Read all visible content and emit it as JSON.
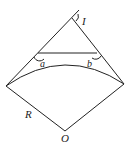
{
  "diagram": {
    "labels": {
      "apex": "I",
      "angle_a": "a",
      "angle_b": "b",
      "radius": "R",
      "center": "O"
    },
    "colors": {
      "stroke": "#222222",
      "background": "#ffffff"
    }
  }
}
